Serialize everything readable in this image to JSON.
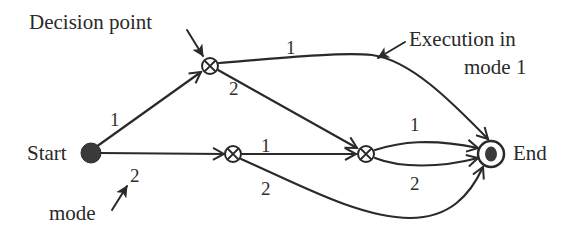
{
  "diagram": {
    "title": "",
    "colors": {
      "stroke": "#2a2a2a",
      "node_fill": "#3a3a3a",
      "background": "#ffffff"
    },
    "nodes": [
      {
        "id": "start",
        "type": "start-filled-circle",
        "label": "Start"
      },
      {
        "id": "d1",
        "type": "decision-point-circled-x",
        "label": ""
      },
      {
        "id": "d2",
        "type": "decision-point-circled-x",
        "label": ""
      },
      {
        "id": "d3",
        "type": "decision-point-circled-x",
        "label": ""
      },
      {
        "id": "end",
        "type": "end-bullseye",
        "label": "End"
      }
    ],
    "edges": [
      {
        "from": "start",
        "to": "d1",
        "mode": "1"
      },
      {
        "from": "start",
        "to": "d2",
        "mode": "2"
      },
      {
        "from": "d1",
        "to": "end",
        "mode": "1"
      },
      {
        "from": "d1",
        "to": "d3",
        "mode": "2"
      },
      {
        "from": "d2",
        "to": "d3",
        "mode": "1"
      },
      {
        "from": "d2",
        "to": "end",
        "mode": "2"
      },
      {
        "from": "d3",
        "to": "end",
        "mode": "1"
      },
      {
        "from": "d3",
        "to": "end",
        "mode": "2"
      }
    ],
    "labels": {
      "start": "Start",
      "end": "End",
      "decision_point": "Decision point",
      "execution_line1": "Execution in",
      "execution_line2": "mode 1",
      "mode": "mode"
    },
    "edge_labels": {
      "start_d1": "1",
      "start_d2": "2",
      "d1_end": "1",
      "d1_d3": "2",
      "d2_d3": "1",
      "d2_end": "2",
      "d3_end_top": "1",
      "d3_end_bottom": "2"
    }
  }
}
